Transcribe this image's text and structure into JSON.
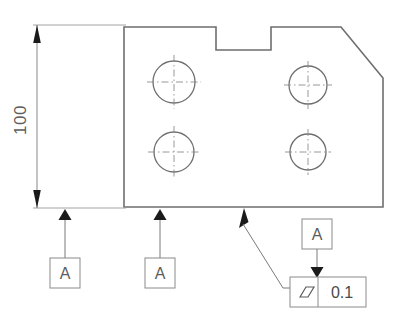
{
  "drawing": {
    "title": "Parallelism tolerance engineering drawing",
    "background_color": "#ffffff",
    "line_color": "#6e6e6e",
    "annotation_color": "#5d5d5d",
    "arrow_color": "#1a1a1a"
  },
  "dimension": {
    "value": "100",
    "orientation": "vertical",
    "arrow_style": "filled-closed-both-ends"
  },
  "datums": [
    {
      "label": "A",
      "id": "datum-a-left",
      "position": "bottom-left-surface"
    },
    {
      "label": "A",
      "id": "datum-a-middle",
      "position": "bottom-middle-surface"
    },
    {
      "label": "A",
      "id": "datum-a-reference",
      "position": "above-feature-control-frame"
    }
  ],
  "feature_control_frame": {
    "symbol_name": "parallelism-symbol",
    "symbol_glyph": "parallelogram",
    "tolerance": "0.1"
  },
  "holes": [
    {
      "id": "hole-top-left",
      "cx": 174,
      "cy": 82,
      "r": 21
    },
    {
      "id": "hole-top-right",
      "cx": 308,
      "cy": 85,
      "r": 19
    },
    {
      "id": "hole-bottom-left",
      "cx": 174,
      "cy": 152,
      "r": 20
    },
    {
      "id": "hole-bottom-right",
      "cx": 308,
      "cy": 152,
      "r": 18
    }
  ],
  "part_outline": {
    "description": "Rectangular plate with top notch and chamfered top-right corner",
    "points": "124,27 216,27 216,50 271,50 271,27 341,27 383,78 383,207 124,207"
  }
}
